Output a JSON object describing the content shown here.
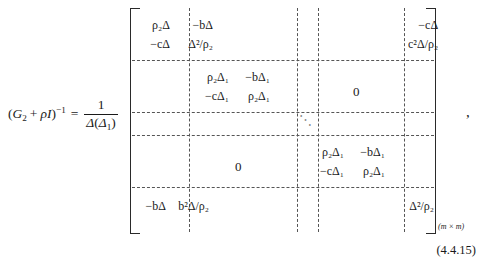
{
  "equation": {
    "lhs": {
      "matrix_symbol": "G",
      "matrix_subscript": "2",
      "plus": "+",
      "rho": "ρ",
      "identity": "I",
      "inverse_exponent": "−1",
      "open_paren": "(",
      "close_paren": ")",
      "equals": "="
    },
    "prefactor": {
      "numerator": "1",
      "denominator_delta": "Δ",
      "denominator_arg_open": "(",
      "denominator_arg_delta": "Δ",
      "denominator_arg_subscript": "1",
      "denominator_arg_close": ")"
    },
    "trailing_punctuation": ",",
    "equation_number": "(4.4.15)"
  },
  "matrix": {
    "dimension_label": "(m × m)",
    "zero_label": "0",
    "ddots_label": "⋱",
    "blocks": [
      {
        "id": "top-left",
        "row1": [
          "ρ₂Δ",
          "−bΔ"
        ],
        "row2": [
          "−cΔ",
          "Δ²/ρ₂"
        ]
      },
      {
        "id": "top-right",
        "row1": [
          "",
          "−cΔ"
        ],
        "row2": [
          "",
          "c²Δ/ρ₂"
        ]
      },
      {
        "id": "middle-upper-diagonal",
        "row1": [
          "ρ₂Δ₁",
          "−bΔ₁"
        ],
        "row2": [
          "−cΔ₁",
          "ρ₂Δ₁"
        ]
      },
      {
        "id": "middle-lower-diagonal",
        "row1": [
          "ρ₂Δ₁",
          "−bΔ₁"
        ],
        "row2": [
          "−cΔ₁",
          "ρ₂Δ₁"
        ]
      },
      {
        "id": "bottom-left",
        "row1": [
          "",
          ""
        ],
        "row2": [
          "−bΔ",
          "b²Δ/ρ₂"
        ]
      },
      {
        "id": "bottom-right",
        "row1": [
          "",
          ""
        ],
        "row2": [
          "",
          "Δ²/ρ₂"
        ]
      }
    ]
  }
}
